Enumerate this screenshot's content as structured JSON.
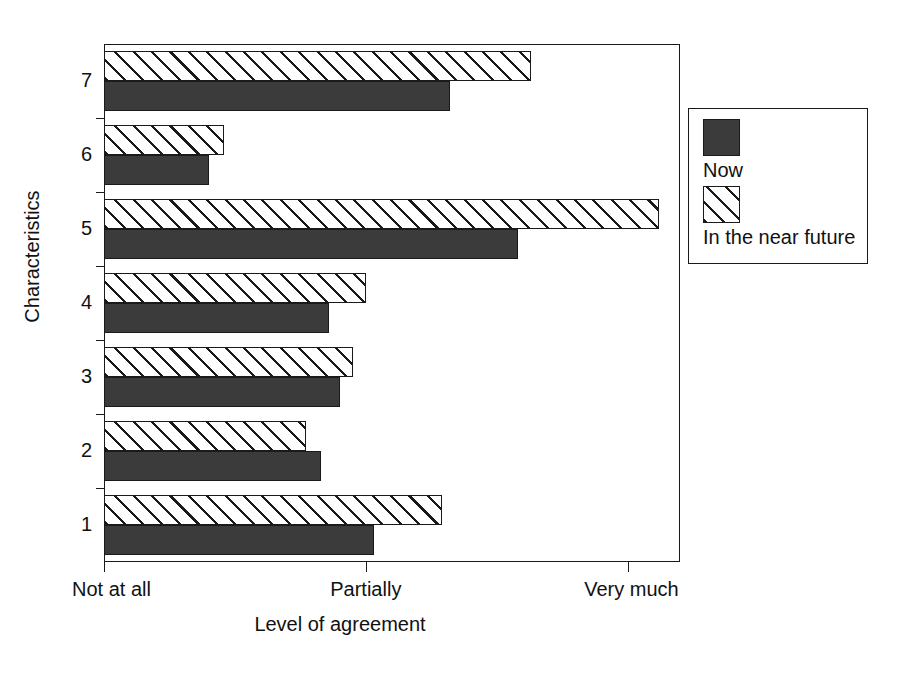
{
  "chart_data": {
    "type": "bar",
    "orientation": "horizontal",
    "title": "",
    "xlabel": "Level of agreement",
    "ylabel": "Characteristics",
    "categories": [
      "1",
      "2",
      "3",
      "4",
      "5",
      "6",
      "7"
    ],
    "xlim": [
      0,
      2.2
    ],
    "xticks": [
      0,
      1,
      2
    ],
    "xticklabels": [
      "Not at all",
      "Partially",
      "Very much"
    ],
    "grid": false,
    "legend_position": "right outside",
    "series": [
      {
        "name": "Now",
        "style": "solid-dark",
        "color": "#3b3b3b",
        "values": [
          1.03,
          0.83,
          0.9,
          0.86,
          1.58,
          0.4,
          1.32
        ]
      },
      {
        "name": "In the near future",
        "style": "diagonal-hatch",
        "color": "#ffffff",
        "values": [
          1.29,
          0.77,
          0.95,
          1.0,
          2.12,
          0.46,
          1.63
        ]
      }
    ]
  },
  "axes": {
    "y_title": "Characteristics",
    "x_title": "Level of agreement",
    "y_tick_labels": [
      "7",
      "6",
      "5",
      "4",
      "3",
      "2",
      "1"
    ],
    "x_tick_labels": [
      "Not at all",
      "Partially",
      "Very much"
    ]
  },
  "legend": {
    "items": [
      {
        "label": "Now",
        "swatch": "solid-dark-swatch"
      },
      {
        "label": "In the near future",
        "swatch": "hatched-swatch"
      }
    ]
  }
}
